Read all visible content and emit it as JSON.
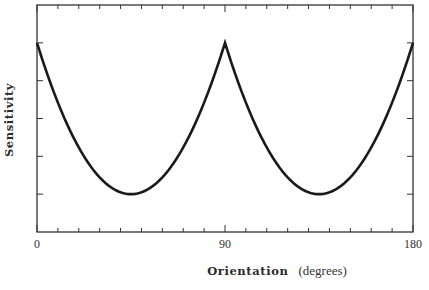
{
  "chart_data": {
    "type": "line",
    "title": "",
    "xlabel": "Orientation",
    "xlabel_unit": "(degrees)",
    "ylabel": "Sensitivity",
    "xlim": [
      0,
      180
    ],
    "ylim": [
      0,
      6
    ],
    "x_tick_labels": [
      "0",
      "90",
      "180"
    ],
    "x_major_ticks": [
      0,
      90,
      180
    ],
    "x_minor_tick_step": 10,
    "y_ticks": [
      1,
      2,
      3,
      4,
      5
    ],
    "y_tick_labels": [],
    "grid": false,
    "legend": null,
    "series": [
      {
        "name": "Sensitivity",
        "color": "#1a1a1a",
        "x": [
          0,
          10,
          20,
          30,
          40,
          45,
          50,
          60,
          70,
          80,
          90,
          100,
          110,
          120,
          130,
          135,
          140,
          150,
          160,
          170,
          180
        ],
        "values": [
          5.0,
          3.44,
          2.23,
          1.44,
          1.05,
          1.0,
          1.05,
          1.44,
          2.23,
          3.44,
          5.0,
          3.44,
          2.23,
          1.44,
          1.05,
          1.0,
          1.05,
          1.44,
          2.23,
          3.44,
          5.0
        ]
      }
    ],
    "annotations": []
  },
  "labels": {
    "x_title_bold": "Orientation",
    "x_title_unit": "(degrees)",
    "y_title": "Sensitivity",
    "x0": "0",
    "x90": "90",
    "x180": "180"
  }
}
